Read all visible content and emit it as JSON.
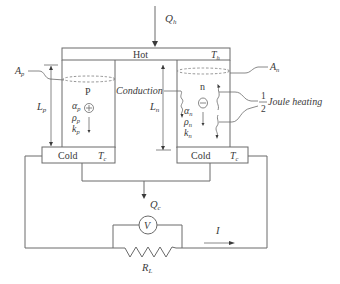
{
  "diagram": {
    "type": "thermoelectric-generator-schematic",
    "hot_junction": {
      "label": "Hot",
      "temperature": "T",
      "temperature_sub": "h"
    },
    "heat_in": {
      "symbol": "Q",
      "sub": "h"
    },
    "heat_out": {
      "symbol": "Q",
      "sub": "c"
    },
    "cold_junction_left": {
      "label": "Cold",
      "temperature": "T",
      "temperature_sub": "c"
    },
    "cold_junction_right": {
      "label": "Cold",
      "temperature": "T",
      "temperature_sub": "c"
    },
    "p_leg": {
      "label": "P",
      "area": {
        "symbol": "A",
        "sub": "p"
      },
      "length": {
        "symbol": "L",
        "sub": "p"
      },
      "carrier_sign": "+",
      "properties": [
        {
          "symbol": "α",
          "sub": "p"
        },
        {
          "symbol": "ρ",
          "sub": "p"
        },
        {
          "symbol": "k",
          "sub": "p"
        }
      ]
    },
    "n_leg": {
      "label": "n",
      "area": {
        "symbol": "A",
        "sub": "n"
      },
      "length": {
        "symbol": "L",
        "sub": "n"
      },
      "carrier_sign": "−",
      "properties": [
        {
          "symbol": "α",
          "sub": "n"
        },
        {
          "symbol": "ρ",
          "sub": "n"
        },
        {
          "symbol": "k",
          "sub": "n"
        }
      ]
    },
    "annotations": {
      "conduction": "Conduction",
      "joule_heating": "Joule heating",
      "fraction_num": "1",
      "fraction_den": "2"
    },
    "circuit": {
      "voltmeter": "V",
      "load_resistor": {
        "symbol": "R",
        "sub": "L"
      },
      "current": "I"
    }
  }
}
